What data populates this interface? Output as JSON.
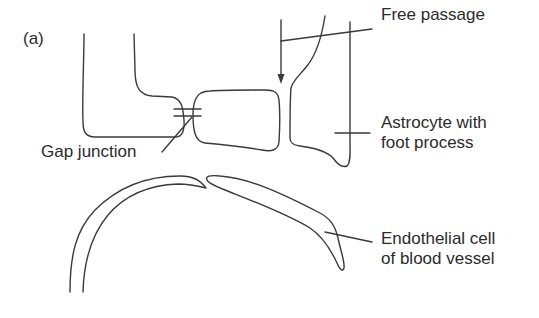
{
  "figure": {
    "panel_label": "(a)",
    "stroke_color": "#3a3a3a",
    "text_color": "#2b2b2b",
    "background": "#ffffff"
  },
  "labels": {
    "free_passage": "Free passage",
    "gap_junction": "Gap junction",
    "astrocyte": {
      "line1": "Astrocyte with",
      "line2": "foot process"
    },
    "endothelial": {
      "line1": "Endothelial cell",
      "line2": "of blood vessel"
    }
  },
  "structures": [
    "left-astrocyte-process",
    "middle-astrocyte-foot",
    "right-astrocyte-foot-process",
    "gap-junction",
    "free-passage-arrow",
    "blood-vessel-wall",
    "endothelial-cell"
  ]
}
